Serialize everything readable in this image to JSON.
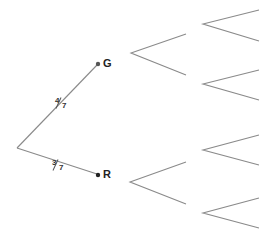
{
  "diagram": {
    "type": "probability-tree",
    "root": {
      "x": 17,
      "y": 148
    },
    "level1": [
      {
        "label": "G",
        "probability": {
          "numerator": "4",
          "denominator": "7"
        },
        "x": 98,
        "y": 64
      },
      {
        "label": "R",
        "probability": {
          "numerator": "3",
          "denominator": "7"
        },
        "x": 98,
        "y": 175
      }
    ],
    "level2_branches": [
      {
        "vertex": [
          131,
          53
        ],
        "ends": [
          [
            186,
            34
          ],
          [
            186,
            75
          ]
        ]
      },
      {
        "vertex": [
          130,
          182
        ],
        "ends": [
          [
            186,
            162
          ],
          [
            186,
            204
          ]
        ]
      }
    ],
    "level3_branches": [
      {
        "vertex": [
          203,
          24
        ],
        "ends": [
          [
            259,
            10
          ],
          [
            259,
            41
          ]
        ]
      },
      {
        "vertex": [
          203,
          84
        ],
        "ends": [
          [
            259,
            70
          ],
          [
            259,
            100
          ]
        ]
      },
      {
        "vertex": [
          203,
          150
        ],
        "ends": [
          [
            259,
            135
          ],
          [
            259,
            165
          ]
        ]
      },
      {
        "vertex": [
          203,
          213
        ],
        "ends": [
          [
            259,
            198
          ],
          [
            259,
            228
          ]
        ]
      }
    ]
  }
}
